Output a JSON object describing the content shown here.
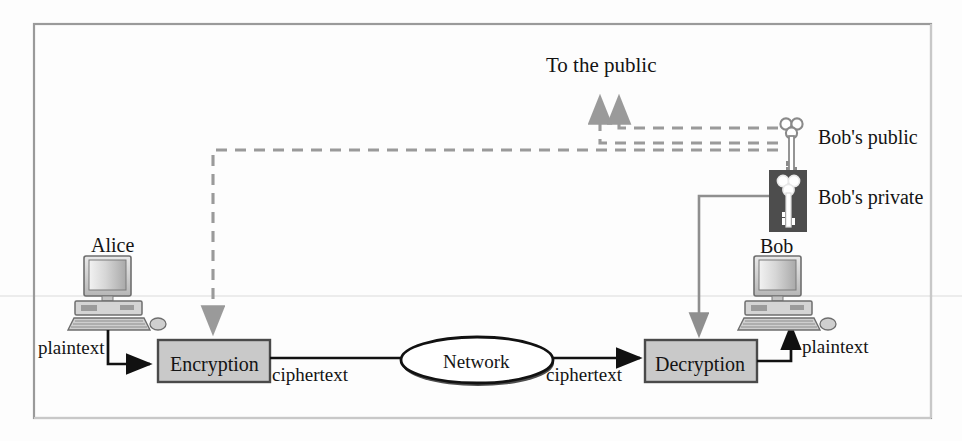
{
  "diagram": {
    "frame": {
      "border_color": "#8d8d8d"
    },
    "colors": {
      "box_fill": "#c9c9c9",
      "box_border": "#4a4a4a",
      "dashed_line": "#9a9a9a",
      "solid_line": "#111111",
      "key_line": "#8f8f8f",
      "private_key_bg": "#4b4b4b",
      "text": "#141414",
      "scan_artifact": "#e6e6e6"
    },
    "labels": {
      "to_the_public": "To the public",
      "alice": "Alice",
      "bob": "Bob",
      "bobs_public": "Bob's public",
      "bobs_private": "Bob's private",
      "plaintext_left": "plaintext",
      "plaintext_right": "plaintext",
      "ciphertext_left": "ciphertext",
      "ciphertext_right": "ciphertext",
      "encryption": "Encryption",
      "decryption": "Decryption",
      "network": "Network"
    },
    "nodes": [
      {
        "id": "alice-computer",
        "kind": "computer",
        "label": "Alice"
      },
      {
        "id": "bob-computer",
        "kind": "computer",
        "label": "Bob"
      },
      {
        "id": "encryption-box",
        "kind": "process",
        "label": "Encryption"
      },
      {
        "id": "decryption-box",
        "kind": "process",
        "label": "Decryption"
      },
      {
        "id": "network-ellipse",
        "kind": "cloud",
        "label": "Network"
      },
      {
        "id": "bobs-public-key",
        "kind": "key",
        "label": "Bob's public"
      },
      {
        "id": "bobs-private-key",
        "kind": "key",
        "label": "Bob's private"
      }
    ],
    "edges": [
      {
        "from": "alice-computer",
        "to": "encryption-box",
        "label": "plaintext",
        "style": "solid"
      },
      {
        "from": "encryption-box",
        "to": "network-ellipse",
        "label": "ciphertext",
        "style": "solid"
      },
      {
        "from": "network-ellipse",
        "to": "decryption-box",
        "label": "ciphertext",
        "style": "solid"
      },
      {
        "from": "decryption-box",
        "to": "bob-computer",
        "label": "plaintext",
        "style": "solid"
      },
      {
        "from": "bobs-public-key",
        "to": "encryption-box",
        "label": "",
        "style": "dashed"
      },
      {
        "from": "bobs-public-key",
        "to": "To the public",
        "label": "",
        "style": "dashed"
      },
      {
        "from": "bobs-private-key",
        "to": "decryption-box",
        "label": "",
        "style": "solid-gray"
      }
    ]
  }
}
